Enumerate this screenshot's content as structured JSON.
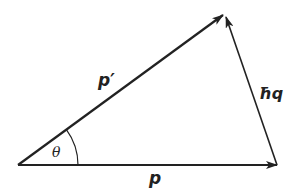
{
  "diagram": {
    "type": "vector-triangle",
    "colors": {
      "line": "#222222",
      "background": "#ffffff"
    },
    "vectors": [
      {
        "id": "p",
        "label": "p",
        "from": [
          18,
          165
        ],
        "to": [
          277,
          165
        ]
      },
      {
        "id": "p_prime",
        "label": "p′",
        "from": [
          18,
          165
        ],
        "to": [
          223,
          15
        ]
      },
      {
        "id": "hbar_q",
        "label": "ħq",
        "from": [
          277,
          165
        ],
        "to": [
          226,
          17
        ]
      }
    ],
    "angle": {
      "label": "θ",
      "vertex": [
        18,
        165
      ],
      "radius": 60
    }
  },
  "labels": {
    "p": "p",
    "p_prime": "p′",
    "hbar_q": "ħq",
    "theta": "θ"
  }
}
